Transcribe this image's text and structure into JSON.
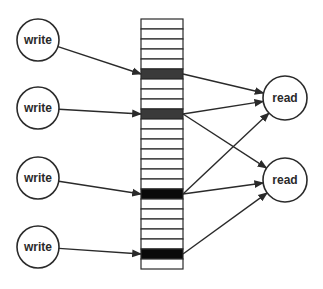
{
  "diagram": {
    "type": "memory-array-read-write",
    "array": {
      "x": 141,
      "y": 19,
      "width": 42,
      "row_height": 10,
      "rows": 25,
      "highlighted_rows": [
        {
          "index": 5,
          "color": "#3a3a3a"
        },
        {
          "index": 9,
          "color": "#3a3a3a"
        },
        {
          "index": 17,
          "color": "#0a0a0a"
        },
        {
          "index": 23,
          "color": "#0a0a0a"
        }
      ]
    },
    "writers": [
      {
        "label": "write",
        "cx": 38,
        "cy": 40,
        "r": 21
      },
      {
        "label": "write",
        "cx": 38,
        "cy": 108,
        "r": 21
      },
      {
        "label": "write",
        "cx": 38,
        "cy": 178,
        "r": 21
      },
      {
        "label": "write",
        "cx": 38,
        "cy": 247,
        "r": 21
      }
    ],
    "readers": [
      {
        "label": "read",
        "cx": 285,
        "cy": 98,
        "r": 22
      },
      {
        "label": "read",
        "cx": 285,
        "cy": 180,
        "r": 22
      }
    ],
    "edges": [
      {
        "from": "write-0",
        "to": "row-5"
      },
      {
        "from": "write-1",
        "to": "row-9"
      },
      {
        "from": "write-2",
        "to": "row-17"
      },
      {
        "from": "write-3",
        "to": "row-23"
      },
      {
        "from": "row-5",
        "to": "read-0"
      },
      {
        "from": "row-9",
        "to": "read-0"
      },
      {
        "from": "row-9",
        "to": "read-1"
      },
      {
        "from": "row-17",
        "to": "read-0"
      },
      {
        "from": "row-17",
        "to": "read-1"
      },
      {
        "from": "row-23",
        "to": "read-1"
      }
    ],
    "colors": {
      "stroke": "#2a2a2a",
      "background": "#ffffff"
    }
  }
}
